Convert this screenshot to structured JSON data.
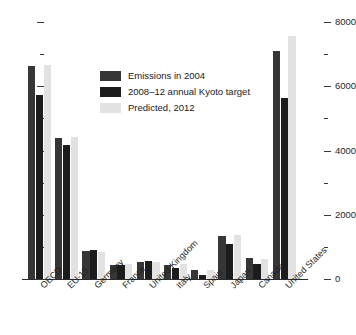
{
  "chart_data": {
    "type": "bar",
    "title": "",
    "subtitle": "",
    "xlabel": "",
    "ylabel": "",
    "ylim": [
      0,
      8000
    ],
    "y_ticks_major": [
      0,
      2000,
      4000,
      6000,
      8000
    ],
    "y_ticks_minor": [
      1000,
      3000,
      5000,
      7000
    ],
    "y_tick_labels": [
      "0",
      "2000",
      "4000",
      "6000",
      "8000"
    ],
    "grid": false,
    "legend_position": "top-left inside plot",
    "axis_position": "right",
    "categories": [
      "OECD",
      "EU-15",
      "Germany",
      "France",
      "United Kingdom",
      "Italy",
      "Spain",
      "Japan",
      "Canada",
      "United States"
    ],
    "series": [
      {
        "name": "Emissions in 2004",
        "color": "#363636",
        "values": [
          6630,
          4400,
          860,
          440,
          540,
          450,
          280,
          1330,
          640,
          7100
        ]
      },
      {
        "name": "2008–12 annual Kyoto target",
        "color": "#1c1c1c",
        "values": [
          5730,
          4170,
          900,
          430,
          550,
          340,
          140,
          1100,
          460,
          5630
        ]
      },
      {
        "name": "Predicted, 2012",
        "color": "#e2e2e2",
        "values": [
          6670,
          4430,
          850,
          460,
          540,
          480,
          270,
          1370,
          630,
          7570
        ]
      }
    ]
  },
  "legend": {
    "items": [
      {
        "label": "Emissions in 2004",
        "color": "#363636"
      },
      {
        "label": "2008–12 annual Kyoto target",
        "color": "#1c1c1c"
      },
      {
        "label": "Predicted, 2012",
        "color": "#e2e2e2"
      }
    ]
  },
  "colors": {
    "background": "#ffffff",
    "axis": "#2b2b2b",
    "text": "#1a1a1a",
    "series_1": "#363636",
    "series_2": "#1c1c1c",
    "series_3": "#e2e2e2"
  }
}
